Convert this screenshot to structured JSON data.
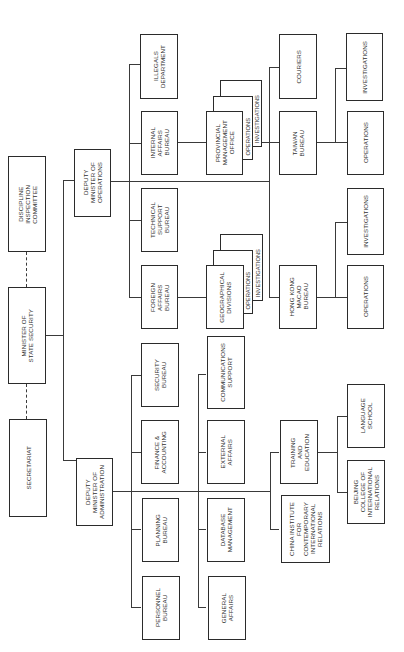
{
  "diagram": {
    "type": "organizational-chart",
    "orientation": "rotated-90-ccw",
    "top_level": {
      "minister": "MINISTER OF\nSTATE SECURITY",
      "discipline": "DISCIPLINE\nINSPECTION\nCOMMITTEE",
      "secretariat": "SECRETARIAT"
    },
    "deputies": {
      "operations": "DEPUTY\nMINISTER OF\nOPERATIONS",
      "administration": "DEPUTY\nMINISTER OF\nADMINISTRATION"
    },
    "operations_units": {
      "illegals": "ILLEGALS\nDEPARTMENT",
      "internal_affairs": "INTERNAL\nAFFAIRS\nBUREAU",
      "technical_support": "TECHNICAL\nSUPPORT\nBUREAU",
      "foreign_affairs": "FOREIGN\nAFFAIRS\nBUREAU",
      "provincial_mgmt": "PROVINCIAL\nMANAGEMENT\nOFFICE",
      "provincial_ops": "OPERATIONS",
      "provincial_inv": "INVESTIGATIONS",
      "geographical": "GEOGRAPHICAL\nDIVISIONS",
      "geo_ops": "OPERATIONS",
      "geo_inv": "INVESTIGATIONS",
      "couriers": "COURIERS",
      "taiwan": "TAIWAN\nBUREAU",
      "hongkong": "HONG KONG\nMACAO\nBUREAU",
      "taiwan_inv": "INVESTIGATIONS",
      "taiwan_ops": "OPERATIONS",
      "hk_inv": "INVESTIGATIONS",
      "hk_ops": "OPERATIONS"
    },
    "administration_units": {
      "security": "SECURITY\nBUREAU",
      "finance": "FINANCE &\nACCOUNTING",
      "planning": "PLANNING\nBUREAU",
      "personnel": "PERSONNEL\nBUREAU",
      "communications": "COMMUNICATIONS\nSUPPORT",
      "external": "EXTERNAL\nAFFAIRS",
      "database": "DATABASE\nMANAGEMENT",
      "general": "GENERAL\nAFFAIRS",
      "training": "TRAINING\nAND\nEDUCATION",
      "china_institute": "CHINA INSTITUTE\nFOR\nCONTEMPORARY\nINTERNATIONAL\nRELATIONS",
      "language_school": "LANGUAGE\nSCHOOL",
      "beijing_college": "BEIJING\nCOLLEGE OF\nINTERNATIONAL\nRELATIONS"
    }
  }
}
